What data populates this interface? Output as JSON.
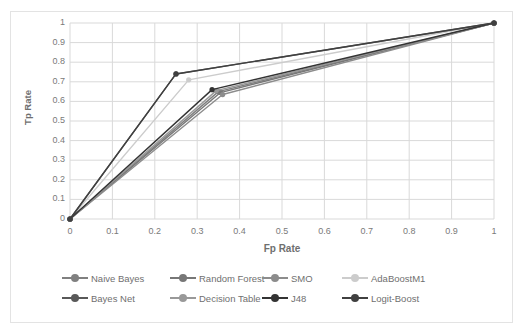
{
  "chart_data": {
    "type": "line",
    "title": "",
    "xlabel": "Fp Rate",
    "ylabel": "Tp Rate",
    "xlim": [
      0,
      1
    ],
    "ylim": [
      0,
      1
    ],
    "xticks": [
      "0",
      "0.1",
      "0.2",
      "0.3",
      "0.4",
      "0.5",
      "0.6",
      "0.7",
      "0.8",
      "0.9",
      "1"
    ],
    "yticks": [
      "0",
      "0.1",
      "0.2",
      "0.3",
      "0.4",
      "0.5",
      "0.6",
      "0.7",
      "0.8",
      "0.9",
      "1"
    ],
    "grid": "both",
    "legend_position": "bottom",
    "series": [
      {
        "name": "Naive Bayes",
        "color": "#808080",
        "x": [
          0,
          0.35,
          1
        ],
        "y": [
          0,
          0.65,
          1
        ]
      },
      {
        "name": "Random Forest",
        "color": "#777777",
        "x": [
          0,
          0.355,
          1
        ],
        "y": [
          0,
          0.645,
          1
        ]
      },
      {
        "name": "SMO",
        "color": "#8c8c8c",
        "x": [
          0,
          0.36,
          1
        ],
        "y": [
          0,
          0.635,
          1
        ]
      },
      {
        "name": "AdaBoostM1",
        "color": "#cccccc",
        "x": [
          0,
          0.28,
          1
        ],
        "y": [
          0,
          0.71,
          1
        ]
      },
      {
        "name": "Bayes Net",
        "color": "#595959",
        "x": [
          0,
          0.25,
          1
        ],
        "y": [
          0,
          0.74,
          1
        ]
      },
      {
        "name": "Decision Table",
        "color": "#999999",
        "x": [
          0,
          0.345,
          1
        ],
        "y": [
          0,
          0.655,
          1
        ]
      },
      {
        "name": "J48",
        "color": "#333333",
        "x": [
          0,
          0.335,
          1
        ],
        "y": [
          0,
          0.66,
          1
        ]
      },
      {
        "name": "Logit-Boost",
        "color": "#404040",
        "x": [
          0,
          0.25,
          1
        ],
        "y": [
          0,
          0.74,
          1
        ]
      }
    ]
  },
  "axes": {
    "y_title": "Tp Rate",
    "x_title": "Fp Rate"
  },
  "legend": {
    "rows": [
      [
        {
          "label": "Naive Bayes",
          "color": "#808080"
        },
        {
          "label": "Random Forest",
          "color": "#777777"
        },
        {
          "label": "SMO",
          "color": "#8c8c8c"
        },
        {
          "label": "AdaBoostM1",
          "color": "#cccccc"
        }
      ],
      [
        {
          "label": "Bayes Net",
          "color": "#595959"
        },
        {
          "label": "Decision Table",
          "color": "#999999"
        },
        {
          "label": "J48",
          "color": "#333333"
        },
        {
          "label": "Logit-Boost",
          "color": "#404040"
        }
      ]
    ]
  },
  "style": {
    "grid_color": "#d9d9d9",
    "axis_text_color": "#7a7a7a",
    "plot_background": "#ffffff"
  }
}
